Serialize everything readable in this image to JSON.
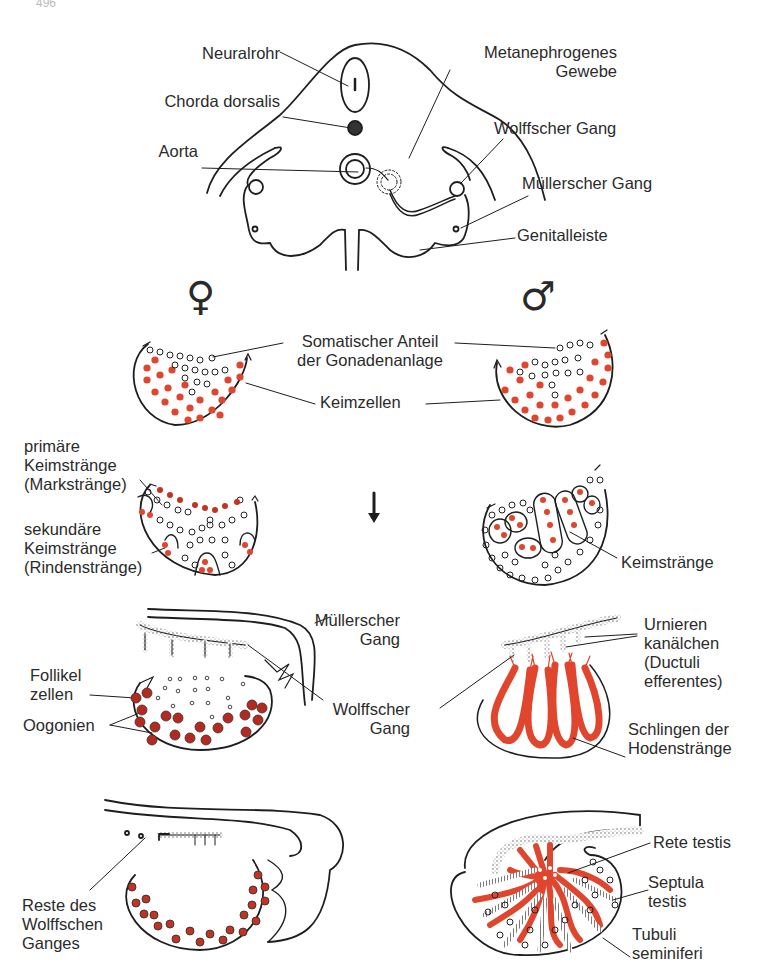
{
  "page": {
    "number": "496"
  },
  "colors": {
    "line": "#1e1e1e",
    "germ_cell_red": "#e0452e",
    "oogonia_red": "#b52a1e",
    "text": "#2b2b2b"
  },
  "top_section": {
    "labels": {
      "neuralrohr": "Neuralrohr",
      "chorda": "Chorda dorsalis",
      "aorta": "Aorta",
      "metanephrogenes_1": "Metanephrogenes",
      "metanephrogenes_2": "Gewebe",
      "wolff": "Wolffscher Gang",
      "mueller": "Müllerscher Gang",
      "genitalleiste": "Genitalleiste"
    }
  },
  "sex_symbols": {
    "female": "♀",
    "male": "♂"
  },
  "stage1": {
    "somatic_1": "Somatischer Anteil",
    "somatic_2": "der Gonadenanlage",
    "keimzellen": "Keimzellen"
  },
  "stage2": {
    "primary_1": "primäre",
    "primary_2": "Keimstränge",
    "primary_3": "(Markstränge)",
    "secondary_1": "sekundäre",
    "secondary_2": "Keimstränge",
    "secondary_3": "(Rindenstränge)",
    "male_keimstraenge": "Keimstränge"
  },
  "stage3": {
    "mueller_1": "Müllerscher",
    "mueller_2": "Gang",
    "wolff_1": "Wolffscher",
    "wolff_2": "Gang",
    "follikel_1": "Follikel",
    "follikel_2": "zellen",
    "oogonien": "Oogonien",
    "urnieren_1": "Urnieren",
    "urnieren_2": "kanälchen",
    "urnieren_3": "(Ductuli",
    "urnieren_4": "efferentes)",
    "schlingen_1": "Schlingen der",
    "schlingen_2": "Hodenstränge"
  },
  "stage4": {
    "reste_1": "Reste des",
    "reste_2": "Wolffschen",
    "reste_3": "Ganges",
    "rete": "Rete testis",
    "septula_1": "Septula",
    "septula_2": "testis",
    "tubuli_1": "Tubuli",
    "tubuli_2": "seminiferi"
  }
}
